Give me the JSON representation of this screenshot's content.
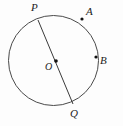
{
  "figure": {
    "kind": "circle-geometry-diagram",
    "background_color": "#fdfdfd",
    "stroke_color": "#4a4a4a",
    "label_color": "#1c1c1c",
    "width": 123,
    "height": 126,
    "circle": {
      "center_x": 53.5,
      "center_y": 60.5,
      "radius": 45,
      "stroke_width": 1
    },
    "chord": {
      "name": "PQ",
      "x1": 38,
      "y1": 20,
      "x2": 73,
      "y2": 104,
      "stroke_width": 1
    },
    "points": [
      {
        "id": "center",
        "label": "O",
        "dot_x": 56,
        "dot_y": 61,
        "dot_r": 1.8,
        "label_x": 45,
        "label_y": 62,
        "on_circle": false
      },
      {
        "id": "p",
        "label": "P",
        "dot_x": 38,
        "dot_y": 20,
        "dot_r": 0,
        "label_x": 31,
        "label_y": 2,
        "on_circle": true
      },
      {
        "id": "a",
        "label": "A",
        "dot_x": 82,
        "dot_y": 19,
        "dot_r": 1.6,
        "label_x": 86,
        "label_y": 6,
        "on_circle": true
      },
      {
        "id": "b",
        "label": "B",
        "dot_x": 96,
        "dot_y": 57,
        "dot_r": 1.6,
        "label_x": 100,
        "label_y": 55,
        "on_circle": true
      },
      {
        "id": "q",
        "label": "Q",
        "dot_x": 73,
        "dot_y": 104,
        "dot_r": 0,
        "label_x": 70,
        "label_y": 108,
        "on_circle": true
      }
    ]
  }
}
